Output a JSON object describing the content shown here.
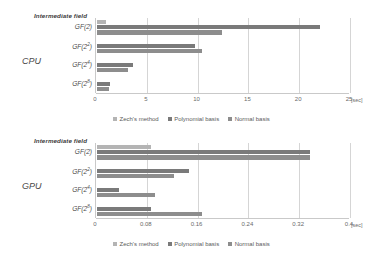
{
  "charts": {
    "cpu": {
      "device_label": "CPU",
      "series_title": "Intermediate field",
      "unit": "[sec]",
      "ticks": [
        "0",
        "5",
        "10",
        "15",
        "20",
        "25"
      ]
    },
    "gpu": {
      "device_label": "GPU",
      "series_title": "Intermediate field",
      "unit": "[sec]",
      "ticks": [
        "0",
        "0.08",
        "0.16",
        "0.24",
        "0.32",
        "0.4"
      ]
    }
  },
  "legend": {
    "entries": [
      {
        "label": "Zech's method",
        "color": "#b4b4b4"
      },
      {
        "label": "Polynomial basis",
        "color": "#7a7a7a"
      },
      {
        "label": "Normal basis",
        "color": "#8d8d8d"
      }
    ]
  },
  "chart_data": [
    {
      "type": "bar",
      "id": "cpu",
      "orientation": "horizontal",
      "title": "Intermediate field",
      "xlabel": "[sec]",
      "ylabel": "CPU",
      "categories": [
        "GF(2)",
        "GF(2^2)",
        "GF(2^4)",
        "GF(2^8)"
      ],
      "category_labels_html": [
        "GF(2)",
        "GF(2<sup>2</sup>)",
        "GF(2<sup>4</sup>)",
        "GF(2<sup>8</sup>)"
      ],
      "series": [
        {
          "name": "Zech's method",
          "color": "#b4b4b4",
          "values": [
            0.9,
            0,
            0,
            0
          ]
        },
        {
          "name": "Polynomial basis",
          "color": "#7a7a7a",
          "values": [
            21.9,
            9.6,
            3.5,
            1.3
          ]
        },
        {
          "name": "Normal basis",
          "color": "#8d8d8d",
          "values": [
            12.3,
            10.3,
            3.1,
            1.2
          ]
        }
      ],
      "xlim": [
        0,
        25
      ],
      "xticks": [
        0,
        5,
        10,
        15,
        20,
        25
      ],
      "grid": true,
      "legend_position": "bottom"
    },
    {
      "type": "bar",
      "id": "gpu",
      "orientation": "horizontal",
      "title": "Intermediate field",
      "xlabel": "[sec]",
      "ylabel": "GPU",
      "categories": [
        "GF(2)",
        "GF(2^2)",
        "GF(2^4)",
        "GF(2^8)"
      ],
      "category_labels_html": [
        "GF(2)",
        "GF(2<sup>2</sup>)",
        "GF(2<sup>4</sup>)",
        "GF(2<sup>8</sup>)"
      ],
      "series": [
        {
          "name": "Zech's method",
          "color": "#b4b4b4",
          "values": [
            0.085,
            0,
            0,
            0
          ]
        },
        {
          "name": "Polynomial basis",
          "color": "#7a7a7a",
          "values": [
            0.335,
            0.145,
            0.035,
            0.085
          ]
        },
        {
          "name": "Normal basis",
          "color": "#8d8d8d",
          "values": [
            0.335,
            0.122,
            0.092,
            0.166
          ]
        }
      ],
      "xlim": [
        0,
        0.4
      ],
      "xticks": [
        0,
        0.08,
        0.16,
        0.24,
        0.32,
        0.4
      ],
      "grid": true,
      "legend_position": "bottom"
    }
  ]
}
